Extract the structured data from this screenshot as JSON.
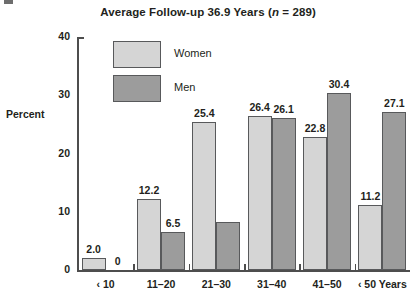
{
  "chart_data": {
    "type": "bar",
    "title": "Average Follow-up 36.9 Years (n = 289)",
    "title_prefix": "Average Follow-up 36.9 Years (",
    "title_n": "n",
    "title_suffix": " = 289)",
    "xlabel": "",
    "ylabel": "Percent",
    "ylim": [
      0,
      40
    ],
    "yticks": [
      0,
      10,
      20,
      30,
      40
    ],
    "ytick_labels": [
      "0",
      "10",
      "20",
      "30",
      "40"
    ],
    "grid": false,
    "legend_position": "top-left-inside",
    "categories": [
      "‹ 10",
      "11–20",
      "21–30",
      "31–40",
      "41–50",
      "‹ 50 Years"
    ],
    "series": [
      {
        "name": "Women",
        "color": "#d5d5d5",
        "values": [
          2.0,
          12.2,
          25.4,
          26.4,
          22.8,
          11.2
        ],
        "labels": [
          "2.0",
          "12.2",
          "25.4",
          "26.4",
          "22.8",
          "11.2"
        ]
      },
      {
        "name": "Men",
        "color": "#9c9c9c",
        "values": [
          0,
          6.5,
          8.3,
          26.1,
          30.4,
          27.1
        ],
        "labels": [
          "0",
          "6.5",
          "",
          "26.1",
          "30.4",
          "27.1"
        ]
      }
    ]
  },
  "legend": {
    "items": [
      {
        "label": "Women",
        "swatch": "women"
      },
      {
        "label": "Men",
        "swatch": "men"
      }
    ]
  }
}
